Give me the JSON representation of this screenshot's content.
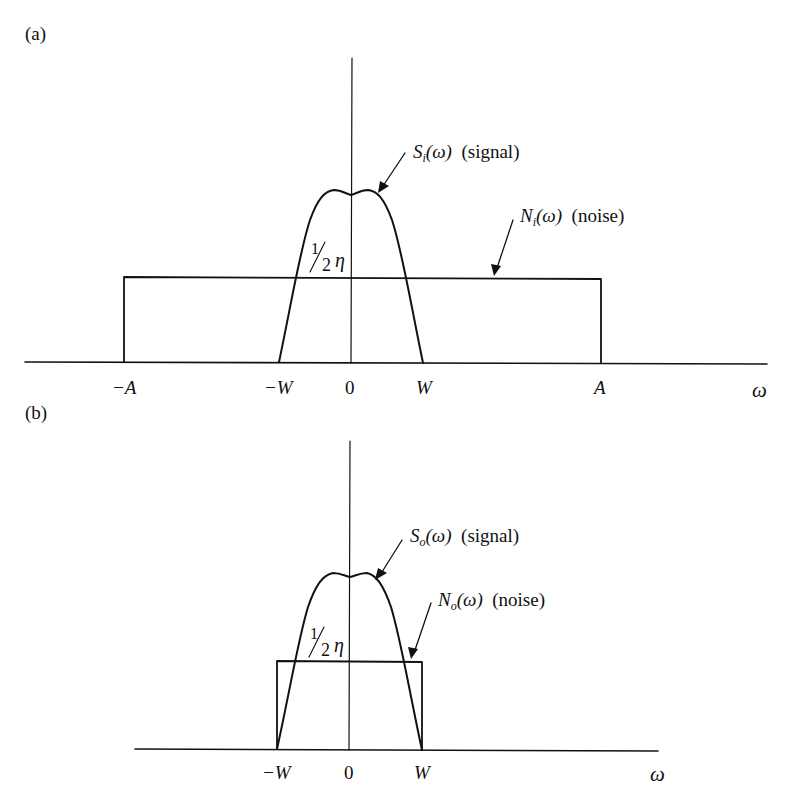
{
  "panels": [
    {
      "id": "a",
      "panel_label": "(a)",
      "signal_label": {
        "symbol": "S",
        "sub": "i",
        "arg": "(ω)",
        "desc": "(signal)"
      },
      "noise_label": {
        "symbol": "N",
        "sub": "i",
        "arg": "(ω)",
        "desc": "(noise)"
      },
      "noise_level_label": {
        "num": "1",
        "den": "2",
        "sym": "η"
      },
      "ticks": [
        "−A",
        "−W",
        "0",
        "W",
        "A"
      ],
      "axis_label": "ω"
    },
    {
      "id": "b",
      "panel_label": "(b)",
      "signal_label": {
        "symbol": "S",
        "sub": "o",
        "arg": "(ω)",
        "desc": "(signal)"
      },
      "noise_label": {
        "symbol": "N",
        "sub": "o",
        "arg": "(ω)",
        "desc": "(noise)"
      },
      "noise_level_label": {
        "num": "1",
        "den": "2",
        "sym": "η"
      },
      "ticks": [
        "−W",
        "0",
        "W"
      ],
      "axis_label": "ω"
    }
  ],
  "colors": {
    "line": "#111111",
    "background": "#ffffff"
  }
}
